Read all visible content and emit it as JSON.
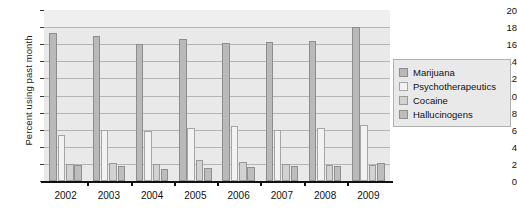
{
  "chart_data": {
    "type": "bar",
    "title": "",
    "subtitle": "",
    "xlabel": "",
    "ylabel": "Percent using past month",
    "categories": [
      "2002",
      "2003",
      "2004",
      "2005",
      "2006",
      "2007",
      "2008",
      "2009"
    ],
    "series": [
      {
        "name": "Marijuana",
        "values": [
          17.3,
          17.0,
          16.0,
          16.6,
          16.2,
          16.3,
          16.4,
          18.0
        ]
      },
      {
        "name": "Psychotherapeutics",
        "values": [
          5.4,
          6.0,
          5.8,
          6.2,
          6.4,
          6.0,
          6.2,
          6.6
        ]
      },
      {
        "name": "Cocaine",
        "values": [
          2.0,
          2.1,
          2.0,
          2.5,
          2.2,
          2.0,
          1.9,
          1.9
        ]
      },
      {
        "name": "Hallucinogens",
        "values": [
          1.9,
          1.7,
          1.4,
          1.5,
          1.6,
          1.7,
          1.8,
          2.1
        ]
      }
    ],
    "ylim": [
      0,
      20
    ],
    "yticks": [
      0,
      2,
      4,
      6,
      8,
      10,
      12,
      14,
      16,
      18,
      20
    ],
    "ytick_labels": [
      "0",
      "2",
      "4",
      "6",
      "8",
      "10",
      "12",
      "14",
      "16",
      "18",
      "20"
    ],
    "grid": true,
    "legend_position": "right",
    "legend_entries": [
      "Marijuana",
      "Psychotherapeutics",
      "Cocaine",
      "Hallucinogens"
    ],
    "colors": {
      "marijuana": "#b9b9b9",
      "psychotherapeutics": "#f2f2f2",
      "cocaine": "#d2d2d2",
      "hallucinogens": "#bdbdbd",
      "plot_background": "#e9e9e9",
      "gridline": "#b4b4b4",
      "axis": "#111111",
      "page_background": "#ffffff"
    }
  }
}
